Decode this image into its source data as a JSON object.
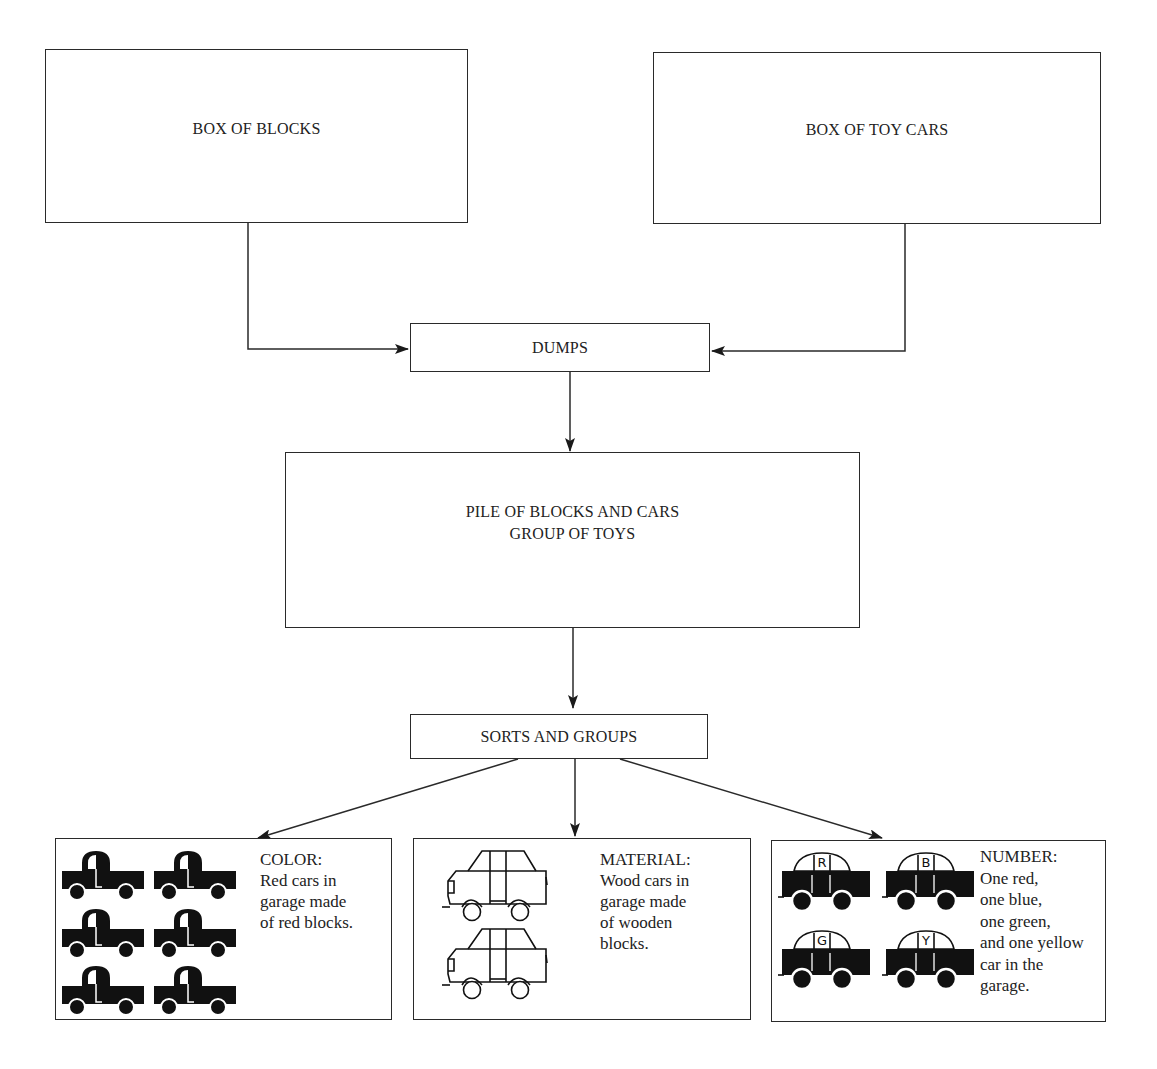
{
  "diagram": {
    "colors": {
      "line": "#2a2a2a",
      "background": "#ffffff",
      "ink": "#111111"
    },
    "nodes": {
      "box_of_blocks": {
        "label": "BOX OF BLOCKS"
      },
      "box_of_toy_cars": {
        "label": "BOX OF TOY CARS"
      },
      "dumps": {
        "label": "DUMPS"
      },
      "pile": {
        "line1": "PILE OF BLOCKS AND CARS",
        "line2": "GROUP OF TOYS"
      },
      "sorts": {
        "label": "SORTS AND GROUPS"
      }
    },
    "edges": [
      {
        "from": "box_of_blocks",
        "to": "dumps"
      },
      {
        "from": "box_of_toy_cars",
        "to": "dumps"
      },
      {
        "from": "dumps",
        "to": "pile"
      },
      {
        "from": "pile",
        "to": "sorts"
      },
      {
        "from": "sorts",
        "to": "color"
      },
      {
        "from": "sorts",
        "to": "material"
      },
      {
        "from": "sorts",
        "to": "number"
      }
    ],
    "outcomes": {
      "color": {
        "title": "COLOR:",
        "lines": [
          "Red cars in",
          "garage made",
          "of red blocks."
        ],
        "icon": "solid-truck-icon",
        "icon_count": 6
      },
      "material": {
        "title": "MATERIAL:",
        "lines": [
          "Wood cars in",
          "garage made",
          "of wooden",
          "blocks."
        ],
        "icon": "outline-car-icon",
        "icon_count": 2
      },
      "number": {
        "title": "NUMBER:",
        "lines": [
          "One red,",
          "one blue,",
          "one green,",
          "and one yellow",
          "car in the",
          "garage."
        ],
        "icon": "lettered-car-icon",
        "car_letters": [
          "R",
          "B",
          "G",
          "Y"
        ]
      }
    }
  }
}
